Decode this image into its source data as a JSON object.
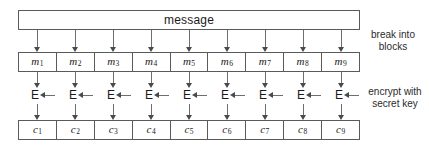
{
  "diagram": {
    "message_bar": {
      "label": "message"
    },
    "message_blocks": [
      {
        "base": "m",
        "index": "1"
      },
      {
        "base": "m",
        "index": "2"
      },
      {
        "base": "m",
        "index": "3"
      },
      {
        "base": "m",
        "index": "4"
      },
      {
        "base": "m",
        "index": "5"
      },
      {
        "base": "m",
        "index": "6"
      },
      {
        "base": "m",
        "index": "7"
      },
      {
        "base": "m",
        "index": "8"
      },
      {
        "base": "m",
        "index": "9"
      }
    ],
    "encrypt_units": [
      {
        "label": "E"
      },
      {
        "label": "E"
      },
      {
        "label": "E"
      },
      {
        "label": "E"
      },
      {
        "label": "E"
      },
      {
        "label": "E"
      },
      {
        "label": "E"
      },
      {
        "label": "E"
      },
      {
        "label": "E"
      }
    ],
    "cipher_blocks": [
      {
        "base": "c",
        "index": "1"
      },
      {
        "base": "c",
        "index": "2"
      },
      {
        "base": "c",
        "index": "3"
      },
      {
        "base": "c",
        "index": "4"
      },
      {
        "base": "c",
        "index": "5"
      },
      {
        "base": "c",
        "index": "6"
      },
      {
        "base": "c",
        "index": "7"
      },
      {
        "base": "c",
        "index": "8"
      },
      {
        "base": "c",
        "index": "9"
      }
    ],
    "annotations": {
      "break_into_blocks_line1": "break into",
      "break_into_blocks_line2": "blocks",
      "encrypt_with_key_line1": "encrypt with",
      "encrypt_with_key_line2": "secret key"
    },
    "colors": {
      "stroke": "#5a5a5a",
      "arrow": "#4a4a4a",
      "text": "#1a1a1a",
      "background": "#ffffff"
    }
  }
}
